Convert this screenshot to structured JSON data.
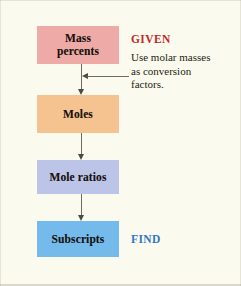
{
  "figure": {
    "background_color": "#fbfaee"
  },
  "flow": {
    "steps": [
      {
        "id": "mass-percents",
        "label": "Mass\npercents",
        "line1": "Mass",
        "line2": "percents",
        "color": "#eeaaa6"
      },
      {
        "id": "moles",
        "label": "Moles",
        "line1": "Moles",
        "line2": "",
        "color": "#f5c390"
      },
      {
        "id": "mole-ratios",
        "label": "Mole ratios",
        "line1": "Mole ratios",
        "line2": "",
        "color": "#bcc4e8"
      },
      {
        "id": "subscripts",
        "label": "Subscripts",
        "line1": "Subscripts",
        "line2": "",
        "color": "#74baea"
      }
    ]
  },
  "labels": {
    "given": "GIVEN",
    "given_color": "#c3282b",
    "find": "FIND",
    "find_color": "#2f77c4"
  },
  "annotation": {
    "line1": "Use molar masses",
    "line2": "as conversion",
    "line3": "factors."
  }
}
